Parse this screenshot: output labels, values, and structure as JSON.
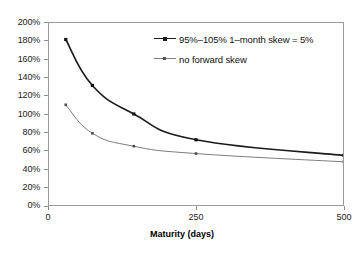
{
  "chart_data": {
    "type": "line",
    "title": "",
    "xlabel": "Maturity (days)",
    "ylabel": "",
    "xlim": [
      0,
      500
    ],
    "ylim": [
      0,
      200
    ],
    "grid": false,
    "legend_position": "top-right",
    "xticks": [
      "0",
      "250",
      "500"
    ],
    "xtick_values": [
      0,
      250,
      500
    ],
    "yticks": [
      "0%",
      "20%",
      "40%",
      "60%",
      "80%",
      "100%",
      "120%",
      "140%",
      "160%",
      "180%",
      "200%"
    ],
    "ytick_values": [
      0,
      20,
      40,
      60,
      80,
      100,
      120,
      140,
      160,
      180,
      200
    ],
    "series": [
      {
        "name": "95%–105% 1–month skew = 5%",
        "color": "#1a1a1a",
        "width": 1.6,
        "marker": "square",
        "x": [
          30,
          75,
          145,
          250,
          500
        ],
        "values": [
          181,
          131,
          100,
          72,
          55
        ]
      },
      {
        "name": "no forward skew",
        "color": "#7d7d7d",
        "width": 1.0,
        "marker": "square",
        "x": [
          30,
          75,
          145,
          250,
          500
        ],
        "values": [
          110,
          79,
          65,
          57,
          48
        ]
      }
    ]
  },
  "axes": {
    "frame_color": "#9a9a9a",
    "tick_color": "#8d8d8d"
  }
}
